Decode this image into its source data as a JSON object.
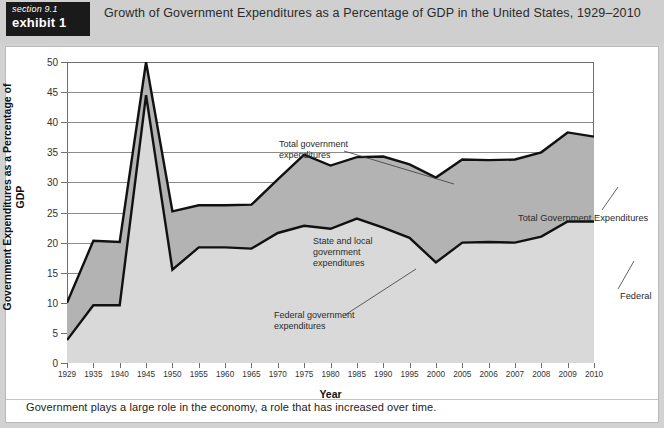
{
  "header": {
    "section_label": "section 9.1",
    "exhibit_label": "exhibit 1",
    "title": "Growth of Government Expenditures as a Percentage of GDP in the United States, 1929–2010"
  },
  "caption": "Government plays a large role in the economy, a role that has increased over time.",
  "annotations": {
    "total_government": "Total government\nexpenditures",
    "state_and_local": "State and local\ngovernment\nexpenditures",
    "federal_government": "Federal government\nexpenditures",
    "total_right": "Total Government Expenditures",
    "federal_right": "Federal"
  },
  "chart_data": {
    "type": "area",
    "title": "Growth of Government Expenditures as a Percentage of GDP in the United States, 1929–2010",
    "xlabel": "Year",
    "ylabel": "Government Expenditures as a Percentage of GDP",
    "ylim": [
      0,
      50
    ],
    "yticks": [
      0,
      5,
      10,
      15,
      20,
      25,
      30,
      35,
      40,
      45,
      50
    ],
    "grid": true,
    "legend_position": "inline-annotations",
    "stacked": true,
    "categories": [
      "1929",
      "1935",
      "1940",
      "1945",
      "1950",
      "1955",
      "1960",
      "1965",
      "1970",
      "1975",
      "1980",
      "1985",
      "1990",
      "1995",
      "2000",
      "2005",
      "2006",
      "2007",
      "2008",
      "2009",
      "2010"
    ],
    "series": [
      {
        "name": "Total government expenditures",
        "color": "#b3b3b3",
        "values": [
          10.0,
          20.3,
          20.1,
          50.0,
          25.2,
          26.2,
          26.2,
          26.3,
          30.5,
          34.6,
          32.8,
          34.2,
          34.3,
          33.0,
          30.8,
          33.8,
          33.7,
          33.8,
          35.0,
          38.3,
          37.6
        ]
      },
      {
        "name": "Federal government expenditures",
        "color": "#d9d9d9",
        "values": [
          3.8,
          9.6,
          9.6,
          44.5,
          15.5,
          19.2,
          19.2,
          19.0,
          21.6,
          22.8,
          22.3,
          24.0,
          22.5,
          20.8,
          16.7,
          20.0,
          20.1,
          20.0,
          21.0,
          23.5,
          23.5
        ]
      }
    ],
    "derived_series": [
      {
        "name": "State and local government expenditures",
        "note": "band between total and federal",
        "values": [
          6.2,
          10.7,
          10.5,
          5.5,
          9.7,
          7.0,
          7.0,
          7.3,
          8.9,
          11.8,
          10.5,
          10.2,
          11.8,
          12.2,
          14.1,
          13.8,
          13.6,
          13.8,
          14.0,
          14.8,
          14.1
        ]
      }
    ]
  },
  "colors": {
    "header_bg": "#cfcfcf",
    "badge_bg": "#1a1a1a",
    "panel_bg": "#ffffff",
    "total_band": "#b3b3b3",
    "federal_band": "#d9d9d9",
    "line": "#111111",
    "grid": "#8b8b8b"
  }
}
